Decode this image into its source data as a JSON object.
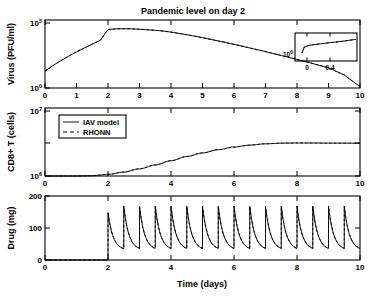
{
  "figure": {
    "title": "Pandemic level on day 2",
    "xlabel": "Time (days)"
  },
  "legend": {
    "items": [
      {
        "label": "IAV model",
        "style": "solid"
      },
      {
        "label": "RHONN",
        "style": "dashed"
      }
    ]
  },
  "panels": {
    "virus": {
      "ylabel": "Virus (PFU/ml)",
      "ytick_labels": [
        "10",
        "10"
      ],
      "ytick_exponents": [
        "0",
        "5"
      ],
      "xtick_labels": [
        "0",
        "1",
        "2",
        "3",
        "4",
        "5",
        "6",
        "7",
        "8",
        "9",
        "10"
      ]
    },
    "cd8": {
      "ylabel": "CD8+ T (cells)",
      "ytick_labels": [
        "10",
        "10"
      ],
      "ytick_exponents": [
        "6",
        "7"
      ],
      "xtick_labels": [
        "0",
        "2",
        "4",
        "6",
        "8",
        "10"
      ]
    },
    "drug": {
      "ylabel": "Drug (mg)",
      "ytick_labels": [
        "0",
        "100",
        "200"
      ],
      "xtick_labels": [
        "0",
        "2",
        "4",
        "6",
        "8",
        "10"
      ]
    }
  },
  "inset": {
    "ytick_label": "10",
    "ytick_exponent": "0",
    "xtick_labels": [
      "0",
      "0.4"
    ]
  },
  "chart_data": [
    {
      "type": "line",
      "panel": "virus",
      "title": "Pandemic level on day 2",
      "xlabel": "",
      "ylabel": "Virus (PFU/ml)",
      "yscale": "log",
      "xlim": [
        0,
        10
      ],
      "ylim": [
        1,
        100000
      ],
      "grid": false,
      "legend_position": "none",
      "series": [
        {
          "name": "IAV model",
          "style": "solid",
          "x": [
            0,
            0.25,
            0.5,
            0.75,
            1,
            1.25,
            1.5,
            1.75,
            2,
            2.25,
            2.5,
            2.75,
            3,
            3.25,
            3.5,
            3.75,
            4,
            4.5,
            5,
            5.5,
            6,
            6.5,
            7,
            7.5,
            8,
            8.5,
            9,
            9.5,
            10
          ],
          "y_log10": [
            1.3,
            1.72,
            2.1,
            2.45,
            2.78,
            3.08,
            3.38,
            3.66,
            4.5,
            4.55,
            4.56,
            4.55,
            4.52,
            4.48,
            4.44,
            4.38,
            4.3,
            4.1,
            3.87,
            3.62,
            3.36,
            3.08,
            2.8,
            2.5,
            2.2,
            1.88,
            1.55,
            1.0,
            0.1
          ]
        },
        {
          "name": "RHONN",
          "style": "dashed",
          "x": [
            0,
            0.25,
            0.5,
            0.75,
            1,
            1.25,
            1.5,
            1.75,
            2,
            2.25,
            2.5,
            2.75,
            3,
            3.25,
            3.5,
            3.75,
            4,
            4.5,
            5,
            5.5,
            6,
            6.5,
            7,
            7.5,
            8,
            8.5,
            9,
            9.5,
            10
          ],
          "y_log10": [
            1.3,
            1.72,
            2.1,
            2.45,
            2.78,
            3.08,
            3.38,
            3.66,
            4.5,
            4.55,
            4.56,
            4.55,
            4.52,
            4.48,
            4.44,
            4.38,
            4.3,
            4.1,
            3.87,
            3.62,
            3.36,
            3.08,
            2.8,
            2.5,
            2.2,
            1.88,
            1.55,
            1.0,
            0.1
          ]
        }
      ]
    },
    {
      "type": "line",
      "panel": "virus-inset",
      "title": "",
      "xlabel": "",
      "ylabel": "",
      "yscale": "log",
      "xlim": [
        -0.08,
        0.72
      ],
      "ylim": [
        1,
        10
      ],
      "grid": false,
      "legend_position": "none",
      "series": [
        {
          "name": "IAV model",
          "style": "solid",
          "x": [
            0.0,
            0.03,
            0.08,
            0.15,
            0.25,
            0.35,
            0.45,
            0.55,
            0.65,
            0.72
          ],
          "y_log10": [
            0.18,
            0.45,
            0.52,
            0.56,
            0.6,
            0.64,
            0.68,
            0.72,
            0.77,
            0.8
          ]
        },
        {
          "name": "RHONN",
          "style": "dashed",
          "x": [
            0.0,
            0.03,
            0.08,
            0.15,
            0.25,
            0.35,
            0.45,
            0.55,
            0.65,
            0.72
          ],
          "y_log10": [
            0.18,
            0.45,
            0.52,
            0.56,
            0.6,
            0.64,
            0.68,
            0.72,
            0.77,
            0.8
          ]
        }
      ]
    },
    {
      "type": "line",
      "panel": "cd8",
      "title": "",
      "xlabel": "",
      "ylabel": "CD8+ T (cells)",
      "yscale": "log",
      "xlim": [
        0,
        10
      ],
      "ylim": [
        1000000,
        10000000
      ],
      "grid": false,
      "legend_position": "upper left",
      "series": [
        {
          "name": "IAV model",
          "style": "solid",
          "x": [
            0,
            0.5,
            1,
            1.5,
            2,
            2.5,
            3,
            3.5,
            4,
            4.5,
            5,
            5.5,
            6,
            6.5,
            7,
            7.5,
            8,
            8.5,
            9,
            9.5,
            10
          ],
          "y_log10": [
            6.0,
            6.0,
            6.0,
            6.005,
            6.025,
            6.06,
            6.11,
            6.17,
            6.235,
            6.3,
            6.355,
            6.405,
            6.445,
            6.475,
            6.495,
            6.505,
            6.508,
            6.508,
            6.506,
            6.505,
            6.505
          ]
        },
        {
          "name": "RHONN",
          "style": "dashed",
          "x": [
            0,
            0.5,
            1,
            1.5,
            2,
            2.5,
            3,
            3.5,
            4,
            4.5,
            5,
            5.5,
            6,
            6.5,
            7,
            7.5,
            8,
            8.5,
            9,
            9.5,
            10
          ],
          "y_log10": [
            6.0,
            6.0,
            6.0,
            6.005,
            6.025,
            6.06,
            6.11,
            6.17,
            6.235,
            6.3,
            6.355,
            6.405,
            6.445,
            6.475,
            6.495,
            6.505,
            6.508,
            6.508,
            6.506,
            6.505,
            6.505
          ]
        }
      ]
    },
    {
      "type": "line",
      "panel": "drug",
      "title": "",
      "xlabel": "Time (days)",
      "ylabel": "Drug (mg)",
      "yscale": "linear",
      "xlim": [
        0,
        10
      ],
      "ylim": [
        0,
        200
      ],
      "grid": false,
      "legend_position": "none",
      "dose_start_day": 2,
      "dose_interval_days": 0.5,
      "dose_count": 16,
      "peak_mg": 168,
      "first_peak_mg": 148,
      "trough_mg": 30,
      "baseline_mg": 0,
      "series": [
        {
          "name": "IAV model",
          "style": "solid"
        },
        {
          "name": "RHONN",
          "style": "dashed"
        }
      ]
    }
  ]
}
